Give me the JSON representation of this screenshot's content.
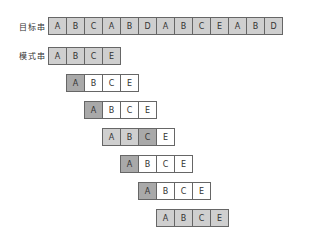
{
  "labels": {
    "target": "目标串",
    "pattern": "模式串"
  },
  "target": [
    "A",
    "B",
    "C",
    "A",
    "B",
    "D",
    "A",
    "B",
    "C",
    "E",
    "A",
    "B",
    "D"
  ],
  "pattern": [
    "A",
    "B",
    "C",
    "E"
  ],
  "rows": [
    {
      "offset": 0,
      "shade": [
        "g",
        "g",
        "g",
        "g"
      ]
    },
    {
      "offset": 1,
      "shade": [
        "dk",
        "",
        "",
        ""
      ]
    },
    {
      "offset": 2,
      "shade": [
        "dk",
        "",
        "",
        ""
      ]
    },
    {
      "offset": 3,
      "shade": [
        "g",
        "g",
        "dk",
        ""
      ]
    },
    {
      "offset": 4,
      "shade": [
        "dk",
        "",
        "",
        ""
      ]
    },
    {
      "offset": 5,
      "shade": [
        "dk",
        "",
        "",
        ""
      ]
    },
    {
      "offset": 6,
      "shade": [
        "g",
        "g",
        "g",
        "g"
      ]
    }
  ],
  "colors": {
    "border": "#666666",
    "shade": "#cfcfcf",
    "mismatch": "#a9a9a9"
  }
}
